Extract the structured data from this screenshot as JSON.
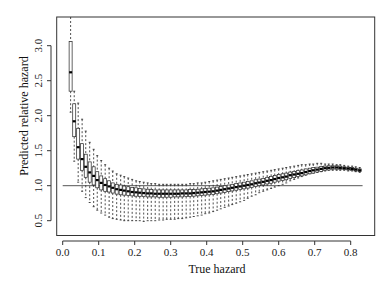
{
  "chart_data": {
    "type": "boxplot",
    "title": "",
    "xlabel": "True hazard",
    "ylabel": "Predicted relative hazard",
    "xlim": [
      -0.016,
      0.865
    ],
    "ylim": [
      0.3,
      3.4
    ],
    "xticks": [
      "0.0",
      "0.1",
      "0.2",
      "0.3",
      "0.4",
      "0.5",
      "0.6",
      "0.7",
      "0.8"
    ],
    "xtick_values": [
      0.0,
      0.1,
      0.2,
      0.3,
      0.4,
      0.5,
      0.6,
      0.7,
      0.8
    ],
    "yticks": [
      "0.5",
      "1.0",
      "1.5",
      "2.0",
      "2.5",
      "3.0"
    ],
    "ytick_values": [
      0.5,
      1.0,
      1.5,
      2.0,
      2.5,
      3.0
    ],
    "grid": false,
    "legend": null,
    "reference_line": {
      "y": 1.0,
      "x_from": 0.0,
      "x_to": 0.833,
      "color": "#555555"
    },
    "box_color": "#222222",
    "whisker_style": "dashed",
    "boxes": {
      "x": [
        0.022,
        0.032,
        0.043,
        0.054,
        0.064,
        0.075,
        0.086,
        0.096,
        0.107,
        0.118,
        0.129,
        0.139,
        0.15,
        0.161,
        0.171,
        0.182,
        0.193,
        0.204,
        0.214,
        0.225,
        0.236,
        0.246,
        0.257,
        0.268,
        0.279,
        0.289,
        0.3,
        0.311,
        0.321,
        0.332,
        0.343,
        0.354,
        0.364,
        0.375,
        0.386,
        0.396,
        0.407,
        0.418,
        0.429,
        0.439,
        0.45,
        0.461,
        0.471,
        0.482,
        0.493,
        0.504,
        0.514,
        0.525,
        0.536,
        0.546,
        0.557,
        0.568,
        0.579,
        0.589,
        0.6,
        0.611,
        0.621,
        0.632,
        0.643,
        0.654,
        0.664,
        0.675,
        0.686,
        0.696,
        0.707,
        0.718,
        0.729,
        0.739,
        0.75,
        0.761,
        0.771,
        0.782,
        0.793,
        0.804,
        0.814,
        0.825
      ],
      "median": [
        2.62,
        1.92,
        1.55,
        1.38,
        1.27,
        1.19,
        1.14,
        1.08,
        1.04,
        1.01,
        0.99,
        0.97,
        0.95,
        0.94,
        0.93,
        0.92,
        0.91,
        0.905,
        0.9,
        0.895,
        0.89,
        0.89,
        0.885,
        0.885,
        0.885,
        0.885,
        0.885,
        0.885,
        0.885,
        0.89,
        0.89,
        0.89,
        0.895,
        0.9,
        0.905,
        0.91,
        0.915,
        0.92,
        0.93,
        0.94,
        0.95,
        0.96,
        0.97,
        0.98,
        0.99,
        1.0,
        1.01,
        1.02,
        1.035,
        1.045,
        1.055,
        1.07,
        1.08,
        1.095,
        1.11,
        1.12,
        1.13,
        1.15,
        1.16,
        1.17,
        1.18,
        1.195,
        1.21,
        1.22,
        1.23,
        1.24,
        1.25,
        1.255,
        1.26,
        1.26,
        1.255,
        1.25,
        1.245,
        1.24,
        1.23,
        1.22
      ],
      "q1": [
        2.35,
        1.7,
        1.38,
        1.22,
        1.12,
        1.05,
        1.01,
        0.97,
        0.94,
        0.92,
        0.91,
        0.895,
        0.88,
        0.87,
        0.865,
        0.86,
        0.855,
        0.85,
        0.845,
        0.845,
        0.84,
        0.84,
        0.84,
        0.835,
        0.835,
        0.835,
        0.835,
        0.84,
        0.84,
        0.84,
        0.845,
        0.845,
        0.85,
        0.855,
        0.86,
        0.865,
        0.87,
        0.875,
        0.885,
        0.895,
        0.905,
        0.915,
        0.925,
        0.935,
        0.945,
        0.955,
        0.965,
        0.975,
        0.99,
        1.0,
        1.01,
        1.025,
        1.035,
        1.05,
        1.065,
        1.075,
        1.085,
        1.105,
        1.115,
        1.13,
        1.14,
        1.155,
        1.17,
        1.18,
        1.195,
        1.205,
        1.22,
        1.225,
        1.235,
        1.235,
        1.235,
        1.23,
        1.225,
        1.22,
        1.21,
        1.205
      ],
      "q3": [
        3.06,
        2.17,
        1.82,
        1.6,
        1.45,
        1.34,
        1.27,
        1.2,
        1.14,
        1.1,
        1.07,
        1.04,
        1.02,
        1.01,
        0.995,
        0.985,
        0.975,
        0.97,
        0.96,
        0.955,
        0.95,
        0.945,
        0.94,
        0.94,
        0.94,
        0.94,
        0.94,
        0.94,
        0.94,
        0.94,
        0.94,
        0.945,
        0.945,
        0.95,
        0.955,
        0.96,
        0.965,
        0.97,
        0.98,
        0.99,
        1.0,
        1.01,
        1.02,
        1.03,
        1.04,
        1.05,
        1.06,
        1.07,
        1.085,
        1.095,
        1.105,
        1.12,
        1.13,
        1.145,
        1.16,
        1.17,
        1.18,
        1.195,
        1.205,
        1.215,
        1.225,
        1.24,
        1.25,
        1.26,
        1.265,
        1.275,
        1.28,
        1.285,
        1.285,
        1.285,
        1.28,
        1.27,
        1.265,
        1.26,
        1.25,
        1.24
      ],
      "lo": [
        2.05,
        1.35,
        1.05,
        0.92,
        0.83,
        0.76,
        0.7,
        0.65,
        0.61,
        0.58,
        0.55,
        0.53,
        0.52,
        0.51,
        0.5,
        0.5,
        0.5,
        0.5,
        0.5,
        0.49,
        0.5,
        0.5,
        0.5,
        0.51,
        0.51,
        0.52,
        0.52,
        0.52,
        0.53,
        0.53,
        0.54,
        0.55,
        0.56,
        0.57,
        0.58,
        0.6,
        0.61,
        0.63,
        0.65,
        0.67,
        0.69,
        0.71,
        0.73,
        0.75,
        0.77,
        0.79,
        0.82,
        0.85,
        0.87,
        0.9,
        0.92,
        0.94,
        0.96,
        0.98,
        1.0,
        1.02,
        1.04,
        1.07,
        1.09,
        1.11,
        1.13,
        1.15,
        1.17,
        1.18,
        1.19,
        1.2,
        1.21,
        1.22,
        1.22,
        1.22,
        1.22,
        1.22,
        1.21,
        1.21,
        1.2,
        1.19
      ],
      "hi": [
        3.45,
        2.35,
        2.18,
        1.95,
        1.78,
        1.62,
        1.52,
        1.43,
        1.36,
        1.3,
        1.25,
        1.21,
        1.17,
        1.15,
        1.13,
        1.11,
        1.09,
        1.07,
        1.06,
        1.05,
        1.04,
        1.03,
        1.03,
        1.02,
        1.02,
        1.02,
        1.02,
        1.02,
        1.02,
        1.02,
        1.02,
        1.03,
        1.03,
        1.04,
        1.04,
        1.05,
        1.06,
        1.07,
        1.08,
        1.09,
        1.1,
        1.11,
        1.12,
        1.13,
        1.14,
        1.15,
        1.16,
        1.17,
        1.18,
        1.19,
        1.2,
        1.21,
        1.22,
        1.23,
        1.24,
        1.25,
        1.26,
        1.27,
        1.28,
        1.29,
        1.3,
        1.3,
        1.31,
        1.31,
        1.32,
        1.32,
        1.31,
        1.31,
        1.31,
        1.3,
        1.3,
        1.29,
        1.28,
        1.28,
        1.27,
        1.26
      ]
    }
  }
}
